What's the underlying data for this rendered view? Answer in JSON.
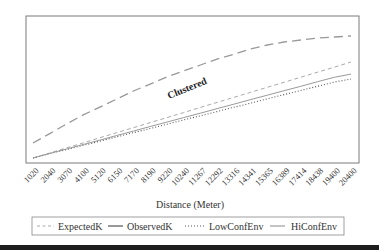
{
  "chart_data": {
    "type": "line",
    "title": "",
    "xlabel": "Distance (Meter)",
    "ylabel": "",
    "y_ticks_shown": false,
    "y_units": "relative (0-100 of plot height, no y tick labels shown)",
    "ylim": [
      0,
      100
    ],
    "grid": false,
    "legend_position": "bottom",
    "x": [
      "1020",
      "2040",
      "3070",
      "4100",
      "5120",
      "6150",
      "7170",
      "8190",
      "9220",
      "10240",
      "11267",
      "12292",
      "13316",
      "14341",
      "15365",
      "16389",
      "17414",
      "18438",
      "19400",
      "20400"
    ],
    "series": [
      {
        "name": "ExpectedK",
        "style": "short-dash",
        "color": "#aaaaaa",
        "values": [
          3.4,
          6.8,
          10.3,
          13.7,
          17.2,
          20.6,
          24.0,
          27.5,
          30.9,
          34.3,
          37.8,
          41.2,
          44.6,
          48.1,
          51.5,
          54.9,
          58.4,
          61.8,
          65.2,
          68.7
        ]
      },
      {
        "name": "ObservedK",
        "style": "long-dash",
        "color": "#999999",
        "values": [
          13.6,
          20.0,
          26.5,
          32.7,
          38.0,
          43.5,
          49.0,
          53.7,
          58.5,
          62.6,
          66.7,
          70.7,
          74.0,
          77.6,
          80.3,
          82.3,
          83.7,
          85.0,
          85.7,
          86.4
        ]
      },
      {
        "name": "LowConfEnv",
        "style": "dotted",
        "color": "#555555",
        "values": [
          3.4,
          6.3,
          9.2,
          12.0,
          14.9,
          17.8,
          20.6,
          23.5,
          26.4,
          29.3,
          32.1,
          35.0,
          37.9,
          40.7,
          43.6,
          46.5,
          49.3,
          52.2,
          55.1,
          57.1
        ]
      },
      {
        "name": "HiConfEnv",
        "style": "solid",
        "color": "#9a9a9a",
        "values": [
          3.4,
          6.5,
          9.5,
          12.6,
          15.6,
          18.7,
          21.7,
          24.8,
          27.8,
          30.9,
          33.9,
          37.0,
          40.0,
          43.1,
          46.1,
          49.2,
          52.2,
          55.3,
          58.3,
          60.5
        ]
      }
    ],
    "annotations": [
      {
        "text": "Clustered",
        "rotation_deg": -22
      }
    ]
  },
  "legend": {
    "items": [
      {
        "label": "ExpectedK"
      },
      {
        "label": "ObservedK"
      },
      {
        "label": "LowConfEnv"
      },
      {
        "label": "HiConfEnv"
      }
    ]
  }
}
